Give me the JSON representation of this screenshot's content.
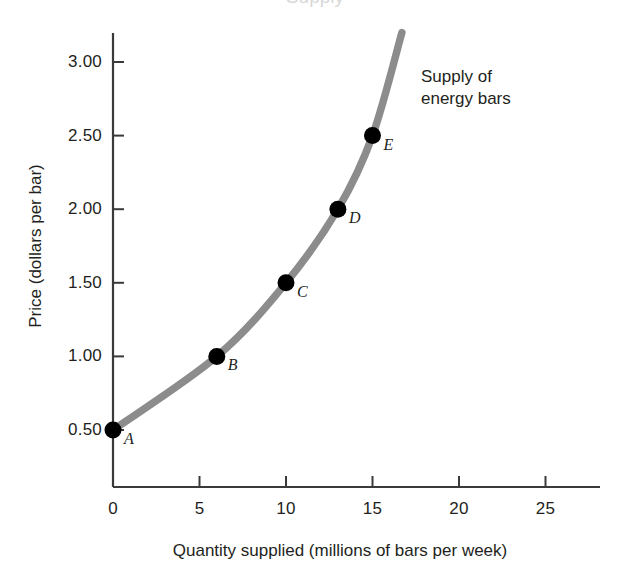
{
  "chart_data": {
    "type": "line",
    "title": "Supply",
    "xlabel": "Quantity supplied (millions of bars per week)",
    "ylabel": "Price (dollars per bar)",
    "xlim": [
      0,
      28
    ],
    "ylim": [
      0,
      3.25
    ],
    "grid": false,
    "legend": null,
    "curve_label": [
      "Supply of",
      "energy bars"
    ],
    "curve_color": "#8c8c8c",
    "point_color": "#000000",
    "axis_color": "#333333",
    "xticks": [
      0,
      5,
      10,
      15,
      20,
      25
    ],
    "xtick_labels": [
      "0",
      "5",
      "10",
      "15",
      "20",
      "25"
    ],
    "yticks": [
      0.5,
      1.0,
      1.5,
      2.0,
      2.5,
      3.0
    ],
    "ytick_labels": [
      "0.50",
      "1.00",
      "1.50",
      "2.00",
      "2.50",
      "3.00"
    ],
    "series": [
      {
        "name": "Supply of energy bars",
        "points": [
          {
            "label": "A",
            "x": 0,
            "y": 0.5
          },
          {
            "label": "B",
            "x": 6,
            "y": 1.0
          },
          {
            "label": "C",
            "x": 10,
            "y": 1.5
          },
          {
            "label": "D",
            "x": 13,
            "y": 2.0
          },
          {
            "label": "E",
            "x": 15,
            "y": 2.5
          }
        ],
        "curve_extends_to": {
          "x": 16.7,
          "y": 3.2
        }
      }
    ]
  }
}
